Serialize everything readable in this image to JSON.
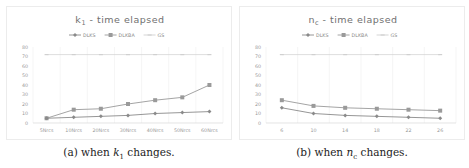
{
  "chart_data": [
    {
      "type": "line",
      "title": "k1 - time elapsed",
      "title_main": "k",
      "title_sub": "1",
      "title_rest": " - time elapsed",
      "xlabel": "",
      "ylabel": "",
      "categories": [
        "5Nrcs",
        "10Nrcs",
        "20Nrcs",
        "30Nrcs",
        "40Nrcs",
        "50Nrcs",
        "60Nrcs"
      ],
      "ylim": [
        0,
        80
      ],
      "yticks": [
        0,
        10,
        20,
        30,
        40,
        50,
        60,
        70,
        80
      ],
      "grid": "vertical",
      "legend_position": "top",
      "series": [
        {
          "name": "DLKS",
          "values": [
            5,
            6,
            7,
            8,
            10,
            11,
            12
          ],
          "color": "#8a8a8a",
          "marker": "diamond"
        },
        {
          "name": "DLKBA",
          "values": [
            5,
            14,
            15,
            20,
            24,
            27,
            40
          ],
          "color": "#9a9a9a",
          "marker": "square"
        },
        {
          "name": "GS",
          "values": [
            72,
            72,
            72,
            72,
            72,
            72,
            72
          ],
          "color": "#d0d0d0",
          "marker": "dash"
        }
      ]
    },
    {
      "type": "line",
      "title": "nc - time elapsed",
      "title_main": "n",
      "title_sub": "c",
      "title_rest": " - time elapsed",
      "xlabel": "",
      "ylabel": "",
      "categories": [
        "6",
        "10",
        "14",
        "18",
        "22",
        "26"
      ],
      "ylim": [
        0,
        80
      ],
      "yticks": [
        0,
        10,
        20,
        30,
        40,
        50,
        60,
        70,
        80
      ],
      "grid": "vertical",
      "legend_position": "top",
      "series": [
        {
          "name": "DLKS",
          "values": [
            16,
            10,
            8,
            7,
            6,
            5
          ],
          "color": "#8a8a8a",
          "marker": "diamond"
        },
        {
          "name": "DLKBA",
          "values": [
            24,
            18,
            16,
            15,
            14,
            13
          ],
          "color": "#9a9a9a",
          "marker": "square"
        },
        {
          "name": "GS",
          "values": [
            72,
            72,
            72,
            72,
            72,
            72
          ],
          "color": "#d0d0d0",
          "marker": "dash"
        }
      ]
    }
  ],
  "captions": {
    "a": {
      "prefix": "(a) when ",
      "var": "k",
      "sub": "1",
      "suffix": " changes."
    },
    "b": {
      "prefix": "(b) when ",
      "var": "n",
      "sub": "c",
      "suffix": " changes."
    }
  }
}
